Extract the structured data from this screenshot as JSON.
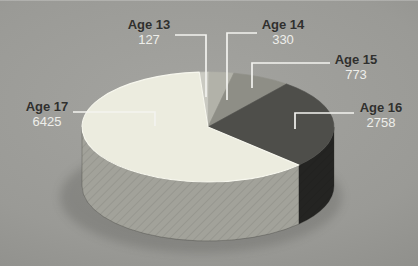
{
  "chart_data": {
    "type": "pie",
    "style": "3d-cylinder-pie",
    "labels": [
      "Age 13",
      "Age 14",
      "Age 15",
      "Age 16",
      "Age 17"
    ],
    "values": [
      127,
      330,
      773,
      2758,
      6425
    ],
    "legend_position": "callout-labels",
    "start_angle_deg": -4,
    "direction": "clockwise",
    "colors_top": [
      "#cacac2",
      "#b2b2a9",
      "#8e8e86",
      "#4e4e4a",
      "#ececdf"
    ],
    "colors_side": [
      "#a8a8a0",
      "#90908a",
      "#6f6f69",
      "#242422",
      "#a2a29a"
    ]
  },
  "colors": {
    "background": "#9a9a96",
    "callout_title": "#30302e",
    "callout_value": "#eeeeea",
    "leader_line": "#f3f3ef"
  }
}
